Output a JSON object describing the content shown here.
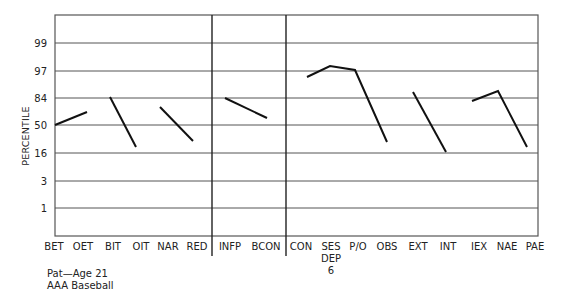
{
  "chart_data": {
    "type": "line",
    "title": "",
    "xlabel": "",
    "ylabel": "PERCENTILE",
    "y_ticks": [
      "99",
      "97",
      "84",
      "50",
      "16",
      "3",
      "1"
    ],
    "grid": true,
    "legend": null,
    "categories": [
      "BET",
      "OET",
      "BIT",
      "OIT",
      "NAR",
      "RED",
      "INFP",
      "BCON",
      "CON",
      "SES DEP 6",
      "P/O",
      "OBS",
      "EXT",
      "INT",
      "IEX",
      "NAE",
      "PAE"
    ],
    "category_labels": [
      {
        "lines": [
          "BET"
        ]
      },
      {
        "lines": [
          "OET"
        ]
      },
      {
        "lines": [
          "BIT"
        ]
      },
      {
        "lines": [
          "OIT"
        ]
      },
      {
        "lines": [
          "NAR"
        ]
      },
      {
        "lines": [
          "RED"
        ]
      },
      {
        "lines": [
          "INFP"
        ]
      },
      {
        "lines": [
          "BCON"
        ]
      },
      {
        "lines": [
          "CON"
        ]
      },
      {
        "lines": [
          "SES",
          "DEP",
          "6"
        ]
      },
      {
        "lines": [
          "P/O"
        ]
      },
      {
        "lines": [
          "OBS"
        ]
      },
      {
        "lines": [
          "EXT"
        ]
      },
      {
        "lines": [
          "INT"
        ]
      },
      {
        "lines": [
          "IEX"
        ]
      },
      {
        "lines": [
          "NAE"
        ]
      },
      {
        "lines": [
          "PAE"
        ]
      }
    ],
    "sections": [
      [
        "BET",
        "OET",
        "BIT",
        "OIT",
        "NAR",
        "RED"
      ],
      [
        "INFP",
        "BCON"
      ],
      [
        "CON",
        "SES DEP 6",
        "P/O",
        "OBS",
        "EXT",
        "INT",
        "IEX",
        "NAE",
        "PAE"
      ]
    ],
    "segments": [
      {
        "from": "BET",
        "to": "OET",
        "values": [
          50,
          70
        ]
      },
      {
        "from": "BIT",
        "to": "OIT",
        "values": [
          84,
          25
        ]
      },
      {
        "from": "NAR",
        "to": "RED",
        "values": [
          73,
          32
        ]
      },
      {
        "from": "INFP",
        "to": "BCON",
        "values": [
          84,
          60
        ]
      },
      {
        "from": "CON",
        "to": "OBS",
        "values": [
          94,
          98,
          97,
          30
        ]
      },
      {
        "from": "EXT",
        "to": "INT",
        "values": [
          87,
          16
        ]
      },
      {
        "from": "IEX",
        "to": "PAE",
        "values": [
          80,
          87,
          22
        ]
      }
    ],
    "pixel_points": [
      [
        [
          55,
          125
        ],
        [
          87,
          112
        ]
      ],
      [
        [
          110,
          97
        ],
        [
          136,
          147
        ]
      ],
      [
        [
          160,
          107
        ],
        [
          193,
          141
        ]
      ],
      [
        [
          225,
          98
        ],
        [
          267,
          118
        ]
      ],
      [
        [
          307,
          77
        ],
        [
          330,
          66
        ],
        [
          355,
          70
        ],
        [
          387,
          142
        ]
      ],
      [
        [
          413,
          92
        ],
        [
          446,
          152
        ]
      ],
      [
        [
          472,
          101
        ],
        [
          498,
          91
        ],
        [
          527,
          147
        ]
      ]
    ]
  },
  "caption": {
    "line1": "Pat—Age 21",
    "line2": "AAA Baseball"
  },
  "layout": {
    "plot": {
      "left": 55,
      "right": 538,
      "top": 15,
      "bottom": 236
    },
    "gridlines_y": [
      43,
      71,
      98,
      125,
      153,
      181,
      208
    ],
    "dividers_x": [
      212,
      286
    ],
    "category_x": [
      54,
      83,
      113,
      141,
      168,
      197,
      230,
      266,
      301,
      331,
      358,
      387,
      418,
      448,
      479,
      507,
      535
    ],
    "line_color": "#111111",
    "grid_color": "#555555"
  }
}
